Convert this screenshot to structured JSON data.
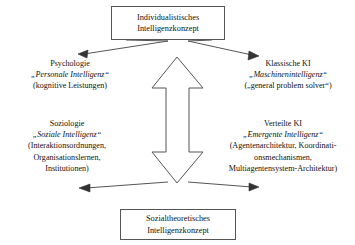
{
  "diagram": {
    "title_top": {
      "line1": "Individualistisches",
      "line2": "Intelligenzkonzept"
    },
    "title_bottom": {
      "line1": "Sozialtheoretisches",
      "line2": "Intelligenzkonzept"
    },
    "quadrants": [
      {
        "id": "psychology",
        "heading": "Psychologie",
        "term": "„Personale Intelligenz“",
        "detail": "(kognitive Leistungen)"
      },
      {
        "id": "classic-ai",
        "heading": "Klassische KI",
        "term": "„Maschinenintelligenz“",
        "detail": "(„general problem solver“)"
      },
      {
        "id": "sociology",
        "heading": "Soziologie",
        "term": "„Soziale Intelligenz“",
        "detail_line1": "(Interaktionsordnungen,",
        "detail_line2": "Organisationslernen,",
        "detail_line3": "Institutionen)"
      },
      {
        "id": "distributed-ai",
        "heading": "Verteilte KI",
        "term": "„Emergente Intelligenz“",
        "detail_line1": "(Agentenarchitektur, Koordinati-",
        "detail_line2": "onsmechanismen,",
        "detail_line3": "Multiagentensystem-Architektur)"
      }
    ],
    "colors": {
      "stroke": "#555555",
      "text": "#111111",
      "background": "#ffffff"
    }
  }
}
